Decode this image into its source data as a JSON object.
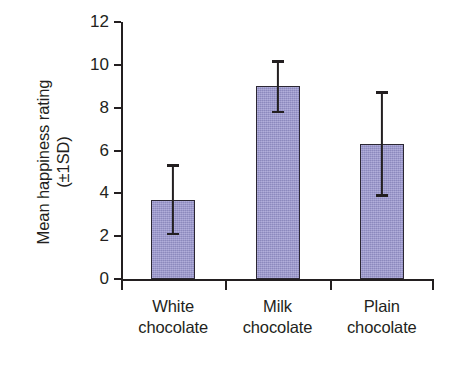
{
  "chart_data": {
    "type": "bar",
    "title": "",
    "xlabel": "",
    "ylabel": "Mean happiness rating (±1SD)",
    "ylabel_line1": "Mean happiness rating",
    "ylabel_line2": "(±1SD)",
    "categories": [
      "White chocolate",
      "Milk chocolate",
      "Plain chocolate"
    ],
    "category_lines": [
      {
        "line1": "White",
        "line2": "chocolate"
      },
      {
        "line1": "Milk",
        "line2": "chocolate"
      },
      {
        "line1": "Plain",
        "line2": "chocolate"
      }
    ],
    "values": [
      3.7,
      9.0,
      6.3
    ],
    "errors": [
      1.6,
      1.15,
      2.4
    ],
    "error_type": "±1SD",
    "error_upper": [
      5.3,
      10.15,
      8.7
    ],
    "error_lower": [
      2.1,
      7.8,
      3.9
    ],
    "ylim": [
      0,
      12
    ],
    "ytick_values": [
      0,
      2,
      4,
      6,
      8,
      10,
      12
    ],
    "ytick_labels": [
      "0",
      "2",
      "4",
      "6",
      "8",
      "10",
      "12"
    ],
    "grid": false,
    "legend": false,
    "bar_color": "#9a96cf",
    "bar_edge_color": "#2b2733",
    "axis_color": "#231f20",
    "background_color": "#ffffff"
  }
}
